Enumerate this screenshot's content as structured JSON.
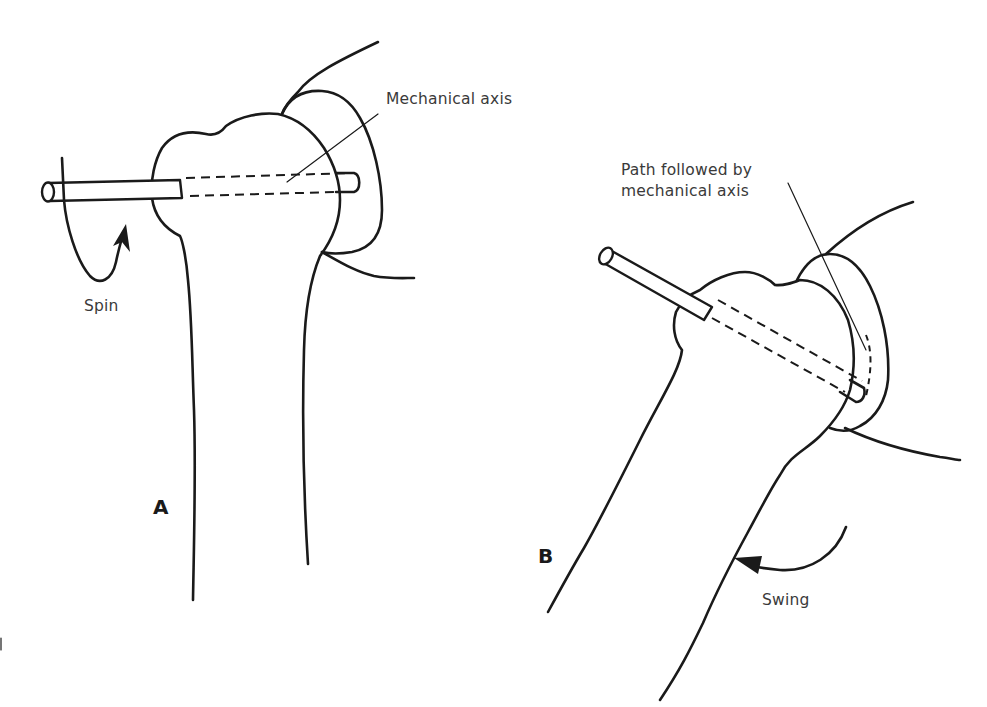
{
  "figure": {
    "panel_a": {
      "letter": "A",
      "labels": {
        "axis": "Mechanical axis",
        "motion": "Spin"
      }
    },
    "panel_b": {
      "letter": "B",
      "labels": {
        "path_line1": "Path followed by",
        "path_line2": "mechanical axis",
        "motion": "Swing"
      }
    },
    "colors": {
      "ink": "#1a1a1a",
      "label_text": "#3a3a3a",
      "background": "#ffffff"
    }
  }
}
